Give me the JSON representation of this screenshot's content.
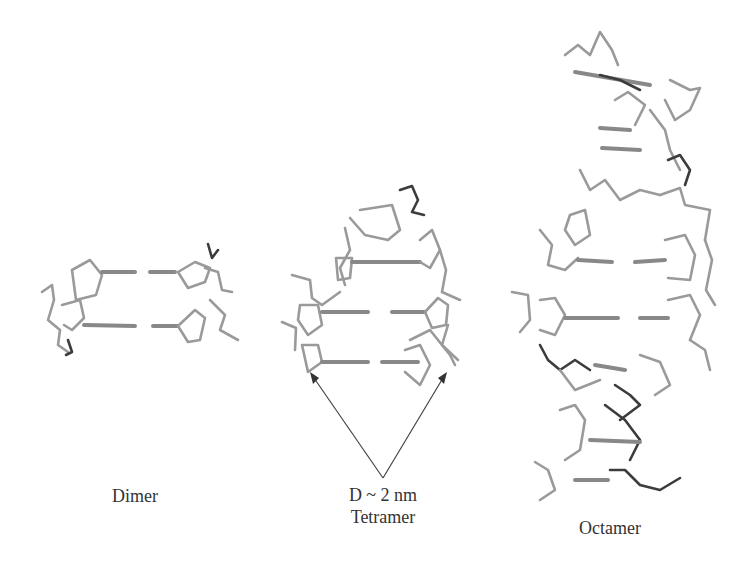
{
  "figure": {
    "structures": [
      {
        "name": "Dimer",
        "label": "Dimer"
      },
      {
        "name": "Tetramer",
        "label": "Tetramer",
        "annotation": "D ~ 2 nm"
      },
      {
        "name": "Octamer",
        "label": "Octamer"
      }
    ],
    "colors": {
      "background": "#ffffff",
      "backbone": "#9a9a9a",
      "dark_atoms": "#3c3c3c",
      "text": "#333333"
    }
  }
}
